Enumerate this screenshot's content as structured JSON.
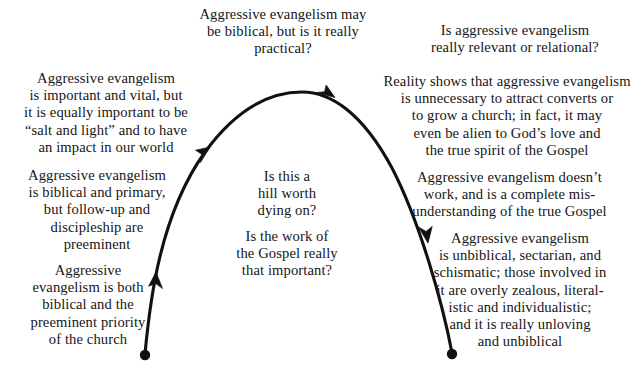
{
  "diagram": {
    "stroke_color": "#111111",
    "background_color": "#ffffff",
    "text_color": "#161616",
    "annotations": {
      "top_center": "Aggressive evangelism may\nbe biblical, but is it really\npractical?",
      "top_right": "Is aggressive evangelism\nreally relevant or relational?",
      "left_1": "Aggressive evangelism\nis important and vital, but\nit is equally important to be\n“salt and light” and to have\nan impact in our world",
      "left_2": "Aggressive evangelism\nis biblical and primary,\nbut follow-up and\ndiscipleship are\npreeminent",
      "left_3": "Aggressive\nevangelism is both\nbiblical and the\npreeminent priority\nof the church",
      "center_1": "Is this a\nhill worth\ndying on?",
      "center_2": "Is the work of\nthe Gospel really\nthat important?",
      "right_1": "Reality shows that aggressive evangelism\nis unnecessary to attract converts or\nto grow a church; in fact, it may\neven be alien to God’s love and\nthe true spirit of the Gospel",
      "right_2": "Aggressive evangelism doesn’t\nwork, and is a complete mis-\nunderstanding of the true Gospel",
      "right_3": "Aggressive evangelism\nis unbiblical, sectarian, and\nschismatic; those involved in\nit are overly zealous, literal-\nistic and individualistic;\nand it is really unloving\nand unbiblical"
    }
  }
}
